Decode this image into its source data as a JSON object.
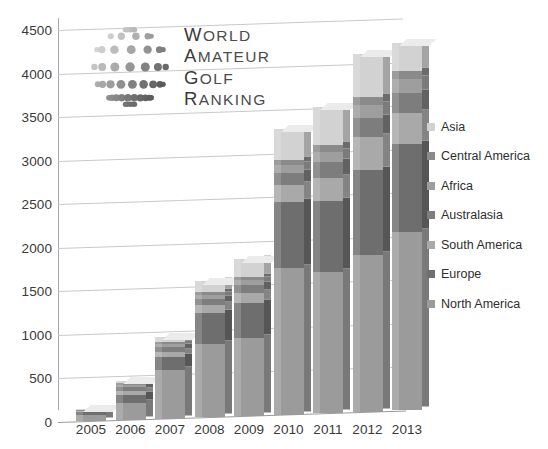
{
  "logo": {
    "ball_icon": "golf-ball-icon",
    "lines": [
      {
        "cap": "W",
        "rest": "ORLD"
      },
      {
        "cap": "A",
        "rest": "MATEUR"
      },
      {
        "cap": "G",
        "rest": "OLF"
      },
      {
        "cap": "R",
        "rest": "ANKING"
      }
    ],
    "alt": "World Amateur Golf Ranking"
  },
  "chart_data": {
    "type": "bar",
    "stacked": true,
    "title": "",
    "xlabel": "",
    "ylabel": "",
    "ylim": [
      0,
      4500
    ],
    "yticks": [
      0,
      500,
      1000,
      1500,
      2000,
      2500,
      3000,
      3500,
      4000,
      4500
    ],
    "grid": true,
    "legend_position": "right",
    "categories": [
      "2005",
      "2006",
      "2007",
      "2008",
      "2009",
      "2010",
      "2011",
      "2012",
      "2013"
    ],
    "series": [
      {
        "name": "North America",
        "color": "#9b9b9b",
        "values": [
          70,
          190,
          560,
          840,
          900,
          1680,
          1620,
          1800,
          2050
        ]
      },
      {
        "name": "Europe",
        "color": "#6e6e6e",
        "values": [
          45,
          100,
          150,
          360,
          400,
          760,
          820,
          980,
          1010
        ]
      },
      {
        "name": "South America",
        "color": "#a9a9a9",
        "values": [
          10,
          45,
          60,
          90,
          110,
          190,
          260,
          370,
          360
        ]
      },
      {
        "name": "Australasia",
        "color": "#7d7d7d",
        "values": [
          8,
          40,
          50,
          70,
          90,
          140,
          180,
          220,
          230
        ]
      },
      {
        "name": "Africa",
        "color": "#9e9e9e",
        "values": [
          5,
          25,
          35,
          45,
          60,
          90,
          120,
          150,
          150
        ]
      },
      {
        "name": "Central America",
        "color": "#8a8a8a",
        "values": [
          3,
          20,
          25,
          30,
          40,
          60,
          80,
          90,
          100
        ]
      },
      {
        "name": "Asia",
        "color": "#d2d2d2",
        "values": [
          4,
          30,
          60,
          125,
          200,
          360,
          440,
          500,
          320
        ]
      }
    ],
    "totals": [
      145,
      450,
      940,
      1560,
      1800,
      3280,
      3520,
      4110,
      4220
    ],
    "legend_order": [
      "Asia",
      "Central America",
      "Africa",
      "Australasia",
      "South America",
      "Europe",
      "North America"
    ]
  }
}
